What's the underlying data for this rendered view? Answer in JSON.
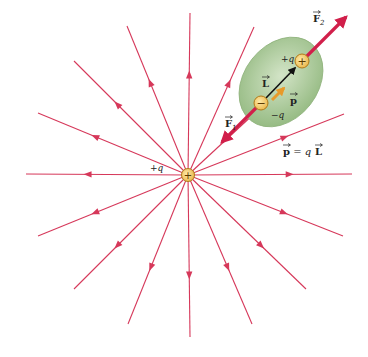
{
  "figure": {
    "colors": {
      "field_line": "#d6385a",
      "force_arrow": "#d11f4a",
      "dipole_blob": "#a8c796",
      "dipole_blob_edge": "#7fa66d",
      "charge_fill": "#f2c75c",
      "charge_edge": "#b07a1a",
      "L_arrow": "#111111",
      "p_arrow": "#e89a2a"
    },
    "source_charge": {
      "label": "+q",
      "symbol": "+",
      "center": [
        188,
        175
      ]
    },
    "field_lines": {
      "count": 16,
      "direction": "outward",
      "endpoints": [
        [
          190,
          13
        ],
        [
          254,
          27
        ],
        [
          312,
          60
        ],
        [
          344,
          114
        ],
        [
          352,
          174
        ],
        [
          343,
          236
        ],
        [
          306,
          289
        ],
        [
          252,
          324
        ],
        [
          190,
          337
        ],
        [
          128,
          324
        ],
        [
          74,
          289
        ],
        [
          38,
          236
        ],
        [
          26,
          174
        ],
        [
          38,
          113
        ],
        [
          74,
          61
        ],
        [
          127,
          26
        ]
      ]
    },
    "dipole": {
      "positive_label": "+q",
      "negative_label": "−q",
      "positive_symbol": "+",
      "negative_symbol": "−",
      "positive_center": [
        302,
        61
      ],
      "negative_center": [
        261,
        103
      ],
      "L_label": "L",
      "p_label": "p",
      "F1_label": "F",
      "F1_subscript": "1",
      "F2_label": "F",
      "F2_subscript": "2"
    },
    "equation": {
      "lhs": "p",
      "eq": " = q",
      "rhs": "L"
    }
  }
}
